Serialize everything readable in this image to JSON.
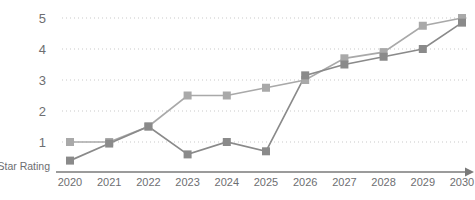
{
  "chart_data": {
    "type": "line",
    "title": "",
    "xlabel": "",
    "ylabel": "Star Rating",
    "categories": [
      "2020",
      "2021",
      "2022",
      "2023",
      "2024",
      "2025",
      "2026",
      "2027",
      "2028",
      "2029",
      "2030"
    ],
    "x": [
      2020,
      2021,
      2022,
      2023,
      2024,
      2025,
      2026,
      2027,
      2028,
      2029,
      2030
    ],
    "ytick_labels": [
      "1",
      "2",
      "3",
      "4",
      "5"
    ],
    "yticks": [
      1,
      2,
      3,
      4,
      5
    ],
    "ylim": [
      0,
      5.35
    ],
    "xlim": [
      2019.6,
      2030.4
    ],
    "grid": "horizontal-dotted",
    "legend": "none",
    "markers": "square",
    "series": [
      {
        "name": "Series 1",
        "color": "#a9a9a9",
        "values": [
          1.0,
          1.0,
          1.5,
          2.5,
          2.5,
          2.75,
          3.0,
          3.7,
          3.9,
          4.75,
          5.0
        ]
      },
      {
        "name": "Series 2",
        "color": "#8a8a8a",
        "values": [
          0.4,
          0.95,
          1.5,
          0.6,
          1.0,
          0.7,
          3.15,
          3.5,
          3.75,
          4.0,
          4.85
        ]
      }
    ]
  },
  "axis": {
    "y_label_text": "Star Rating",
    "x_arrow": "arrow-right"
  },
  "colors": {
    "series_light": "#a9a9a9",
    "series_dark": "#8a8a8a",
    "gridline": "#c9c9c9",
    "axis": "#7a7a7a",
    "text": "#6d6e71",
    "background": "#ffffff"
  }
}
